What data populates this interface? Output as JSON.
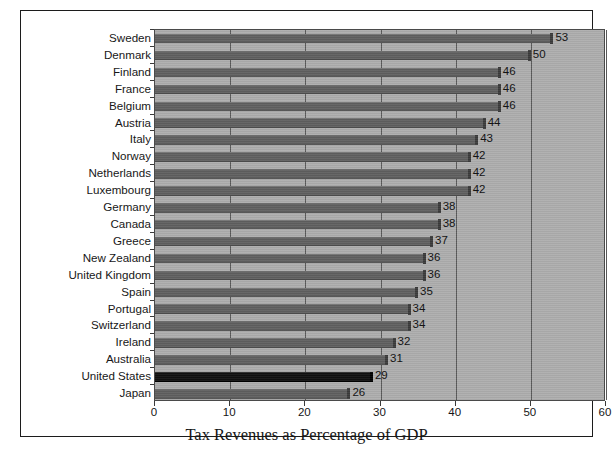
{
  "chart_data": {
    "type": "bar",
    "orientation": "horizontal",
    "title": "",
    "xlabel": "Tax Revenues as Percentage of GDP",
    "ylabel": "",
    "xlim": [
      0,
      60
    ],
    "xticks": [
      0,
      10,
      20,
      30,
      40,
      50,
      60
    ],
    "grid": "vertical",
    "legend": "none",
    "bar_color": "#5f5f5f",
    "highlight_color": "#101010",
    "plot_background": "#adadad",
    "highlight_category": "United States",
    "categories": [
      "Sweden",
      "Denmark",
      "Finland",
      "France",
      "Belgium",
      "Austria",
      "Italy",
      "Norway",
      "Netherlands",
      "Luxembourg",
      "Germany",
      "Canada",
      "Greece",
      "New Zealand",
      "United Kingdom",
      "Spain",
      "Portugal",
      "Switzerland",
      "Ireland",
      "Australia",
      "United States",
      "Japan"
    ],
    "values": [
      53,
      50,
      46,
      46,
      46,
      44,
      43,
      42,
      42,
      42,
      38,
      38,
      37,
      36,
      36,
      35,
      34,
      34,
      32,
      31,
      29,
      26
    ],
    "value_labels": [
      "53",
      "50",
      "46",
      "46",
      "46",
      "44",
      "43",
      "42",
      "42",
      "42",
      "38",
      "38",
      "37",
      "36",
      "36",
      "35",
      "34",
      "34",
      "32",
      "31",
      "29",
      "26"
    ],
    "xtick_labels": [
      "0",
      "10",
      "20",
      "30",
      "40",
      "50",
      "60"
    ]
  }
}
